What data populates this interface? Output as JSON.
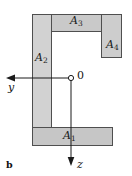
{
  "figure": {
    "panel_label": "b",
    "caption_present": false,
    "colors": {
      "fill": "#d2d2d2",
      "fill_dark": "#c4c4c4",
      "stroke": "#4f4f4f",
      "axis": "#1a1a1a",
      "background": "#ffffff",
      "text": "#141414"
    },
    "areas": [
      {
        "id": "A1",
        "label": "A",
        "subscript": "1",
        "role": "bottom-flange",
        "x": 32,
        "y": 128,
        "width": 81,
        "height": 18
      },
      {
        "id": "A2",
        "label": "A",
        "subscript": "2",
        "role": "left-web",
        "x": 32,
        "y": 14,
        "width": 20,
        "height": 114
      },
      {
        "id": "A3",
        "label": "A",
        "subscript": "3",
        "role": "top-flange",
        "x": 52,
        "y": 14,
        "width": 50,
        "height": 18
      },
      {
        "id": "A4",
        "label": "A",
        "subscript": "4",
        "role": "right-lip",
        "x": 102,
        "y": 14,
        "width": 20,
        "height": 44
      }
    ],
    "axes": {
      "origin": {
        "label": "0",
        "x": 71,
        "y": 78,
        "marker": "open-circle"
      },
      "y_axis": {
        "label": "y",
        "direction": "left",
        "from_x": 71,
        "to_x": 8,
        "y": 78,
        "arrowhead": "left-arrowhead"
      },
      "z_axis": {
        "label": "z",
        "direction": "down",
        "x": 71,
        "from_y": 78,
        "to_y": 163,
        "arrowhead": "down-arrowhead"
      }
    }
  }
}
